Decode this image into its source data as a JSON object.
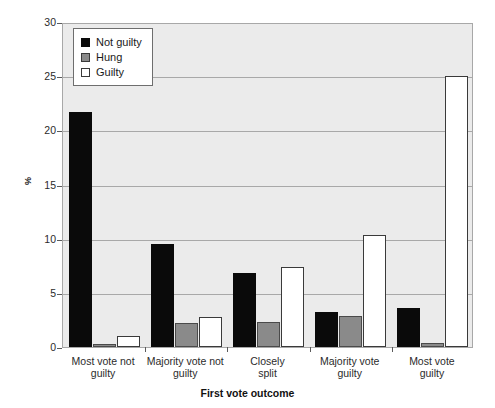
{
  "chart_data": {
    "type": "bar",
    "title": "",
    "xlabel": "First vote outcome",
    "ylabel": "%",
    "ylim": [
      0,
      30
    ],
    "yticks": [
      0,
      5,
      10,
      15,
      20,
      25,
      30
    ],
    "ytick_labels": [
      "0",
      "5",
      "10",
      "15",
      "20",
      "25",
      "30"
    ],
    "grid": true,
    "legend_position": "upper left",
    "categories": [
      "Most vote not guilty",
      "Majority vote not guilty",
      "Closely split",
      "Majority vote guilty",
      "Most vote guilty"
    ],
    "category_lines": [
      [
        "Most vote not",
        "guilty"
      ],
      [
        "Majority vote not",
        "guilty"
      ],
      [
        "Closely",
        "split"
      ],
      [
        "Majority vote",
        "guilty"
      ],
      [
        "Most vote",
        "guilty"
      ]
    ],
    "series": [
      {
        "name": "Not guilty",
        "color": "#0a0a0a",
        "values": [
          21.7,
          9.5,
          6.8,
          3.2,
          3.6
        ]
      },
      {
        "name": "Hung",
        "color": "#8a8a8a",
        "values": [
          0.3,
          2.2,
          2.3,
          2.9,
          0.4
        ]
      },
      {
        "name": "Guilty",
        "color": "#ffffff",
        "values": [
          1.0,
          2.8,
          7.4,
          10.3,
          25.0
        ]
      }
    ]
  },
  "colors": {
    "plot_background": "#ebebeb",
    "gridline": "#a8a8a8",
    "axis": "#5a5a5a",
    "text": "#1a1a1a",
    "page_background": "#ffffff"
  }
}
